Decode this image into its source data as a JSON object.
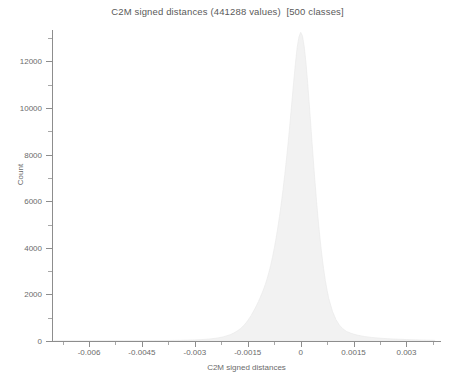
{
  "chart_data": {
    "type": "bar",
    "title": "C2M signed distances (441288 values)  [500 classes]",
    "xlabel": "C2M signed distances",
    "ylabel": "Count",
    "xlim": [
      -0.00705,
      0.00395
    ],
    "ylim": [
      0,
      13350
    ],
    "grid": false,
    "legend": null,
    "n_values": 441288,
    "n_classes": 500,
    "bar_color": "#f2f2f2",
    "bar_edge_color": "#e6e6e6",
    "axis_color": "#8d8d8d",
    "text_color": "#6b6b6b",
    "title_color": "#5a5a5a",
    "background_color": "#ffffff",
    "xticks": [
      -0.006,
      -0.0045,
      -0.003,
      -0.0015,
      0,
      0.0015,
      0.003
    ],
    "xtick_labels": [
      "-0.006",
      "-0.0045",
      "-0.003",
      "-0.0015",
      "0",
      "0.0015",
      "0.003"
    ],
    "xticks_minor": [
      -0.00675,
      -0.00525,
      -0.00375,
      -0.00225,
      -0.00075,
      0.00075,
      0.00225,
      0.00375
    ],
    "yticks": [
      0,
      2000,
      4000,
      6000,
      8000,
      10000,
      12000
    ],
    "ytick_labels": [
      "0",
      "2000",
      "4000",
      "6000",
      "8000",
      "10000",
      "12000"
    ],
    "yticks_minor": [
      1000,
      3000,
      5000,
      7000,
      9000,
      11000,
      13000
    ],
    "x": [
      -0.007,
      -0.0066,
      -0.0062,
      -0.0058,
      -0.0054,
      -0.005,
      -0.0046,
      -0.0042,
      -0.0038,
      -0.0034,
      -0.003,
      -0.0028,
      -0.0026,
      -0.0024,
      -0.0022,
      -0.002,
      -0.0019,
      -0.0018,
      -0.0017,
      -0.00165,
      -0.0016,
      -0.00155,
      -0.0015,
      -0.00145,
      -0.0014,
      -0.00135,
      -0.0013,
      -0.00125,
      -0.0012,
      -0.00115,
      -0.0011,
      -0.00105,
      -0.001,
      -0.00095,
      -0.0009,
      -0.00085,
      -0.0008,
      -0.00075,
      -0.0007,
      -0.00065,
      -0.0006,
      -0.00055,
      -0.0005,
      -0.00045,
      -0.0004,
      -0.00035,
      -0.0003,
      -0.00025,
      -0.0002,
      -0.00015,
      -0.0001,
      -5e-05,
      0.0,
      5e-05,
      0.0001,
      0.00015,
      0.0002,
      0.00025,
      0.0003,
      0.00035,
      0.0004,
      0.00045,
      0.0005,
      0.00055,
      0.0006,
      0.00065,
      0.0007,
      0.00075,
      0.0008,
      0.0009,
      0.001,
      0.0011,
      0.0012,
      0.0013,
      0.00145,
      0.0016,
      0.0018,
      0.002,
      0.0023,
      0.0026,
      0.003,
      0.0034,
      0.0038
    ],
    "values": [
      2,
      3,
      4,
      5,
      6,
      8,
      10,
      14,
      20,
      30,
      48,
      62,
      85,
      120,
      175,
      270,
      340,
      430,
      540,
      610,
      690,
      780,
      880,
      990,
      1110,
      1240,
      1380,
      1530,
      1690,
      1860,
      2040,
      2230,
      2440,
      2680,
      2950,
      3250,
      3590,
      3970,
      4390,
      4850,
      5350,
      5900,
      6500,
      7150,
      7850,
      8600,
      9400,
      10250,
      11100,
      11900,
      12600,
      13050,
      13250,
      13100,
      12650,
      11950,
      11050,
      10050,
      9000,
      7950,
      6950,
      6000,
      5150,
      4380,
      3700,
      3100,
      2600,
      2170,
      1810,
      1280,
      920,
      680,
      520,
      410,
      320,
      255,
      195,
      155,
      115,
      88,
      62,
      44,
      30
    ]
  }
}
